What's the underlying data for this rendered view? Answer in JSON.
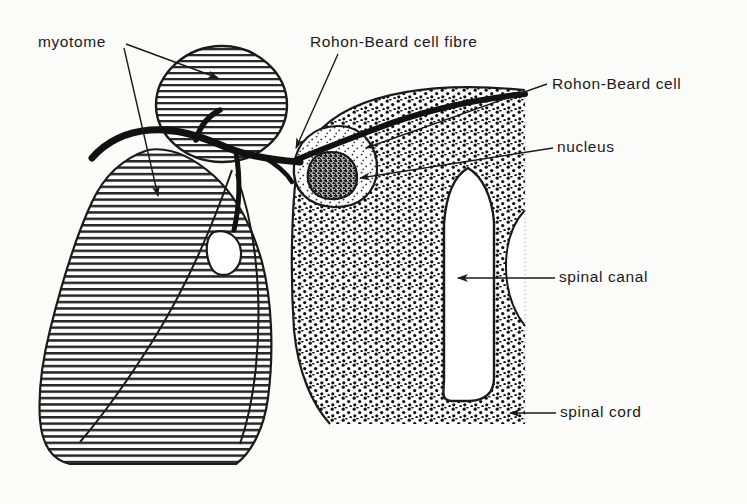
{
  "figure": {
    "type": "anatomical-diagram",
    "background_color": "#fbfbfa",
    "ink_color": "#1a1a1a"
  },
  "labels": [
    {
      "id": "myotome",
      "text": "myotome",
      "x": 38,
      "y": 34,
      "leaders": 2
    },
    {
      "id": "rb-cell-fibre",
      "text": "Rohon-Beard cell fibre",
      "x": 310,
      "y": 34,
      "leaders": 1
    },
    {
      "id": "rb-cell",
      "text": "Rohon-Beard cell",
      "x": 552,
      "y": 76,
      "leaders": 1
    },
    {
      "id": "nucleus",
      "text": "nucleus",
      "x": 557,
      "y": 139,
      "leaders": 1
    },
    {
      "id": "spinal-canal",
      "text": "spinal canal",
      "x": 559,
      "y": 269,
      "leaders": 1
    },
    {
      "id": "spinal-cord",
      "text": "spinal cord",
      "x": 560,
      "y": 404,
      "leaders": 1
    }
  ],
  "structures": [
    {
      "id": "myotome-upper",
      "name": "myotome (upper, circular)",
      "fill": "horizontal-hatch"
    },
    {
      "id": "myotome-lower",
      "name": "myotome (lower, large)",
      "fill": "horizontal-hatch"
    },
    {
      "id": "spinal-cord",
      "name": "spinal cord",
      "fill": "stipple"
    },
    {
      "id": "spinal-canal",
      "name": "spinal canal",
      "fill": "white"
    },
    {
      "id": "rohon-beard-cell",
      "name": "Rohon-Beard cell body",
      "fill": "light-stipple"
    },
    {
      "id": "nucleus",
      "name": "nucleus",
      "fill": "dense-stipple"
    },
    {
      "id": "nerve-fibre",
      "name": "Rohon-Beard cell fibre",
      "fill": "solid-black"
    }
  ]
}
